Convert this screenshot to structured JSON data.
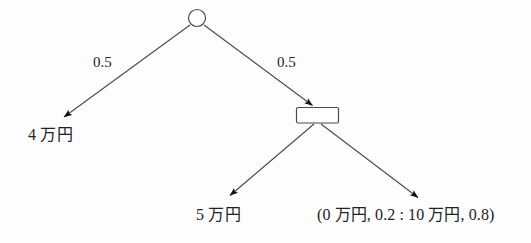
{
  "diagram": {
    "type": "decision-tree",
    "title": "",
    "nodes": [
      {
        "id": "root",
        "shape": "circle",
        "role": "chance-node",
        "label": "",
        "cx": 197,
        "cy": 18,
        "r": 8.5
      },
      {
        "id": "decision",
        "shape": "rectangle",
        "role": "decision-node",
        "label": "",
        "x": 296,
        "y": 107,
        "width": 43,
        "height": 16
      }
    ],
    "edges": [
      {
        "id": "root-to-left",
        "from": "root",
        "to": "terminal-4",
        "probability": "0.5",
        "x1": 190,
        "y1": 25,
        "x2": 62,
        "y2": 118
      },
      {
        "id": "root-to-right",
        "from": "root",
        "to": "decision",
        "probability": "0.5",
        "x1": 204,
        "y1": 25,
        "x2": 313,
        "y2": 106
      },
      {
        "id": "decision-to-left",
        "from": "decision",
        "to": "terminal-5",
        "probability": "",
        "x1": 314,
        "y1": 124,
        "x2": 228,
        "y2": 197
      },
      {
        "id": "decision-to-right",
        "from": "decision",
        "to": "terminal-lottery",
        "probability": "",
        "x1": 321,
        "y1": 124,
        "x2": 420,
        "y2": 199
      }
    ],
    "probability_labels": [
      {
        "id": "prob-left",
        "text": "0.5",
        "x": 93,
        "y": 55
      },
      {
        "id": "prob-right",
        "text": "0.5",
        "x": 277,
        "y": 55
      }
    ],
    "outcome_labels": [
      {
        "id": "outcome-left",
        "text": "4 万円",
        "x": 28,
        "y": 128
      },
      {
        "id": "outcome-mid",
        "text": "5 万円",
        "x": 196,
        "y": 208
      },
      {
        "id": "outcome-right",
        "text": "(0 万円, 0.2 : 10 万円, 0.8)",
        "x": 317,
        "y": 208
      }
    ],
    "colors": {
      "background": "#fdfdfd",
      "stroke": "#4a4a4a",
      "node_fill": "#ffffff",
      "text": "#222222",
      "arrowhead": "#111111"
    }
  }
}
